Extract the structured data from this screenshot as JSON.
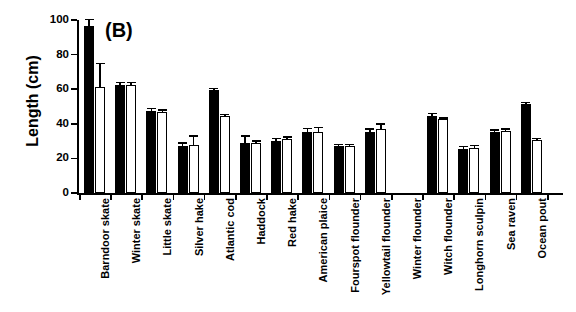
{
  "panel": {
    "label": "(B)"
  },
  "axes": {
    "ylabel": "Length (cm)",
    "xlabel": "",
    "yticks": [
      "0",
      "20",
      "40",
      "60",
      "80",
      "100"
    ]
  },
  "chart_data": {
    "type": "bar",
    "title": "(B)",
    "xlabel": "",
    "ylabel": "Length (cm)",
    "ylim": [
      0,
      100
    ],
    "ytick_values": [
      0,
      20,
      40,
      60,
      80,
      100
    ],
    "grid": false,
    "legend": null,
    "categories": [
      "Barndoor skate",
      "Winter skate",
      "Little skate",
      "Silver hake",
      "Atlantic cod",
      "Haddock",
      "Red hake",
      "American plaice",
      "Fourspot flounder",
      "Yellowtail flounder",
      "Winter flounder",
      "Witch flounder",
      "Longhorn sculpin",
      "Sea raven",
      "Ocean pout"
    ],
    "series": [
      {
        "name": "filled",
        "style": "black filled bar",
        "values": [
          96.5,
          62.5,
          47.5,
          27.0,
          59.5,
          29.0,
          30.0,
          35.0,
          27.0,
          35.5,
          null,
          44.5,
          25.5,
          35.5,
          51.5
        ],
        "errors": [
          3.5,
          1.0,
          1.0,
          1.5,
          0.5,
          3.5,
          1.0,
          2.0,
          0.5,
          1.0,
          null,
          1.0,
          1.0,
          0.5,
          0.5
        ]
      },
      {
        "name": "open",
        "style": "white open bar",
        "values": [
          61.5,
          62.5,
          47.0,
          28.0,
          44.5,
          29.0,
          31.5,
          35.5,
          27.0,
          37.0,
          null,
          42.5,
          26.0,
          36.0,
          30.5
        ],
        "errors": [
          13.0,
          1.0,
          0.5,
          4.5,
          0.5,
          0.5,
          0.5,
          2.0,
          0.5,
          2.5,
          null,
          0.5,
          1.0,
          0.5,
          0.5
        ]
      }
    ]
  }
}
